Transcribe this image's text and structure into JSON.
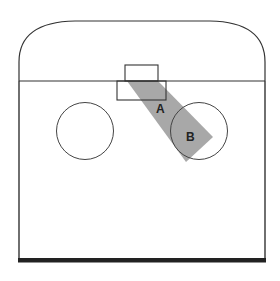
{
  "diagram": {
    "type": "court-plan",
    "labels": {
      "a": "A",
      "b": "B"
    },
    "colors": {
      "line": "#333333",
      "shade": "#a8a8a8",
      "background": "#ffffff"
    },
    "elements": [
      "rounded-top-outline",
      "baseline",
      "small-box-top",
      "box-lower",
      "circle-left",
      "circle-right",
      "shaded-band-diagonal",
      "bottom-thick-line"
    ]
  }
}
